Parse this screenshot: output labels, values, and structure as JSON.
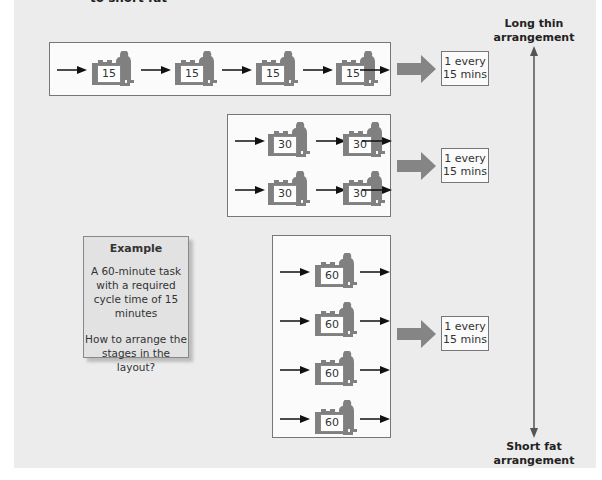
{
  "header": {
    "cut_title": "to short fat"
  },
  "axis": {
    "top_label_line1": "Long thin",
    "top_label_line2": "arrangement",
    "bottom_label_line1": "Short fat",
    "bottom_label_line2": "arrangement"
  },
  "layouts": [
    {
      "name": "long-thin",
      "stage_time": "15",
      "rows": 1,
      "stages_per_row": 4,
      "output_line1": "1 every",
      "output_line2": "15 mins"
    },
    {
      "name": "intermediate",
      "stage_time": "30",
      "rows": 2,
      "stages_per_row": 2,
      "output_line1": "1 every",
      "output_line2": "15 mins"
    },
    {
      "name": "short-fat",
      "stage_time": "60",
      "rows": 4,
      "stages_per_row": 1,
      "output_line1": "1 every",
      "output_line2": "15 mins"
    }
  ],
  "example": {
    "title": "Example",
    "body": "A 60-minute task with a required cycle time of 15 minutes",
    "question": "How to arrange the stages in the layout?"
  },
  "colors": {
    "background": "#ececec",
    "panel": "#fbfbfb",
    "icon": "#808080",
    "big_arrow": "#858585",
    "line": "#555555"
  }
}
